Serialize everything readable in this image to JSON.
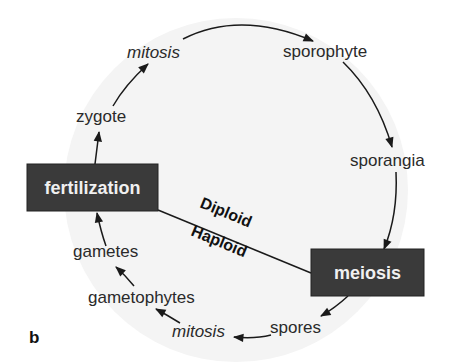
{
  "diagram": {
    "type": "life-cycle",
    "panel_label": "b",
    "events": [
      {
        "id": "fertilization",
        "label": "fertilization"
      },
      {
        "id": "meiosis",
        "label": "meiosis"
      }
    ],
    "stages": [
      {
        "id": "zygote",
        "label": "zygote"
      },
      {
        "id": "mitosis-top",
        "label": "mitosis"
      },
      {
        "id": "sporophyte",
        "label": "sporophyte"
      },
      {
        "id": "sporangia",
        "label": "sporangia"
      },
      {
        "id": "spores",
        "label": "spores"
      },
      {
        "id": "mitosis-bottom",
        "label": "mitosis"
      },
      {
        "id": "gametophytes",
        "label": "gametophytes"
      },
      {
        "id": "gametes",
        "label": "gametes"
      }
    ],
    "divider": {
      "upper": "Diploid",
      "lower": "Haploid"
    },
    "flow": [
      "fertilization",
      "zygote",
      "mitosis-top",
      "sporophyte",
      "sporangia",
      "meiosis",
      "spores",
      "mitosis-bottom",
      "gametophytes",
      "gametes",
      "fertilization"
    ],
    "colors": {
      "box_fill": "#3a3a3a",
      "box_text": "#f0f0f0",
      "circle_fill": "#f4f4f4",
      "line": "#1a1a1a"
    }
  }
}
